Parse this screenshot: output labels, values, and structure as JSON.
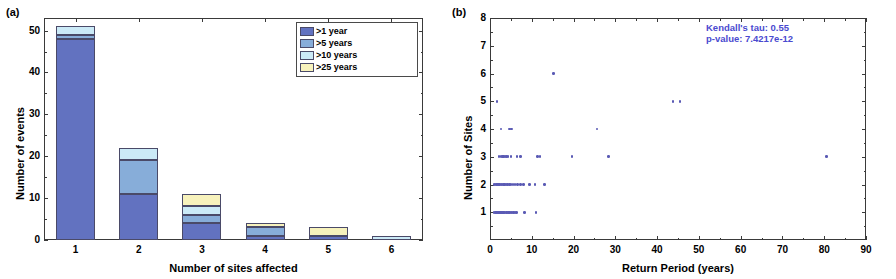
{
  "figure": {
    "panel_a_tag": "(a)",
    "panel_b_tag": "(b)"
  },
  "chart_data": [
    {
      "type": "bar",
      "panel": "(a)",
      "title": "",
      "xlabel": "Number of sites affected",
      "ylabel": "Number of events",
      "categories": [
        "1",
        "2",
        "3",
        "4",
        "5",
        "6"
      ],
      "xticklabels": [
        "1",
        "2",
        "3",
        "4",
        "5",
        "6"
      ],
      "yticklabels": [
        "0",
        "10",
        "20",
        "30",
        "40",
        "50"
      ],
      "ylim": [
        0,
        53
      ],
      "grid": false,
      "stacked": true,
      "legend_position": "top-right",
      "series": [
        {
          "name": ">1 year",
          "color": "#6272c0",
          "values": [
            48,
            11,
            4,
            1,
            1,
            0
          ]
        },
        {
          "name": ">5 years",
          "color": "#87add9",
          "values": [
            1,
            8,
            2,
            2,
            0,
            0
          ]
        },
        {
          "name": ">10 years",
          "color": "#cbeaf7",
          "values": [
            2,
            3,
            2,
            0,
            0,
            1
          ]
        },
        {
          "name": ">25 years",
          "color": "#f7f2bc",
          "values": [
            0,
            0,
            3,
            1,
            2,
            0
          ]
        }
      ],
      "totals": [
        51,
        22,
        11,
        4,
        3,
        1
      ]
    },
    {
      "type": "scatter",
      "panel": "(b)",
      "title": "",
      "xlabel": "Return Period (years)",
      "ylabel": "Number of Sites",
      "xticklabels": [
        "0",
        "10",
        "20",
        "30",
        "40",
        "50",
        "60",
        "70",
        "80",
        "90"
      ],
      "yticklabels": [
        "1",
        "2",
        "3",
        "4",
        "5",
        "6",
        "7",
        "8"
      ],
      "xlim": [
        0,
        90
      ],
      "ylim": [
        0,
        8
      ],
      "grid": false,
      "marker_color": "#5a5ab4",
      "annotations": [
        "Kendall's tau:  0.55",
        "p-value:  7.4217e-12"
      ],
      "points": [
        [
          1.0,
          1
        ],
        [
          1.3,
          1
        ],
        [
          1.5,
          1
        ],
        [
          1.7,
          1
        ],
        [
          1.9,
          1
        ],
        [
          2.1,
          1
        ],
        [
          2.3,
          1
        ],
        [
          2.5,
          1
        ],
        [
          2.6,
          1
        ],
        [
          2.8,
          1
        ],
        [
          3.0,
          1
        ],
        [
          3.2,
          1
        ],
        [
          3.4,
          1
        ],
        [
          3.6,
          1
        ],
        [
          3.9,
          1
        ],
        [
          4.1,
          1
        ],
        [
          4.4,
          1
        ],
        [
          4.7,
          1
        ],
        [
          5.0,
          1
        ],
        [
          5.3,
          1
        ],
        [
          5.6,
          1
        ],
        [
          6.0,
          1
        ],
        [
          6.4,
          1
        ],
        [
          8.3,
          1
        ],
        [
          11.0,
          1
        ],
        [
          1.0,
          2
        ],
        [
          1.2,
          2
        ],
        [
          1.5,
          2
        ],
        [
          1.8,
          2
        ],
        [
          2.0,
          2
        ],
        [
          2.3,
          2
        ],
        [
          2.6,
          2
        ],
        [
          2.9,
          2
        ],
        [
          3.2,
          2
        ],
        [
          3.5,
          2
        ],
        [
          3.8,
          2
        ],
        [
          4.2,
          2
        ],
        [
          4.6,
          2
        ],
        [
          5.0,
          2
        ],
        [
          5.5,
          2
        ],
        [
          6.0,
          2
        ],
        [
          6.6,
          2
        ],
        [
          7.3,
          2
        ],
        [
          8.0,
          2
        ],
        [
          9.4,
          2
        ],
        [
          10.8,
          2
        ],
        [
          13.0,
          2
        ],
        [
          2.2,
          3
        ],
        [
          2.6,
          3
        ],
        [
          3.0,
          3
        ],
        [
          3.3,
          3
        ],
        [
          3.6,
          3
        ],
        [
          3.9,
          3
        ],
        [
          4.3,
          3
        ],
        [
          5.0,
          3
        ],
        [
          6.5,
          3
        ],
        [
          7.3,
          3
        ],
        [
          11.4,
          3
        ],
        [
          12.0,
          3
        ],
        [
          19.6,
          3
        ],
        [
          28.4,
          3
        ],
        [
          80.5,
          3
        ],
        [
          2.6,
          4
        ],
        [
          4.6,
          4
        ],
        [
          5.1,
          4
        ],
        [
          25.6,
          4
        ],
        [
          1.7,
          5
        ],
        [
          43.8,
          5
        ],
        [
          45.5,
          5
        ],
        [
          15.2,
          6
        ]
      ]
    }
  ]
}
